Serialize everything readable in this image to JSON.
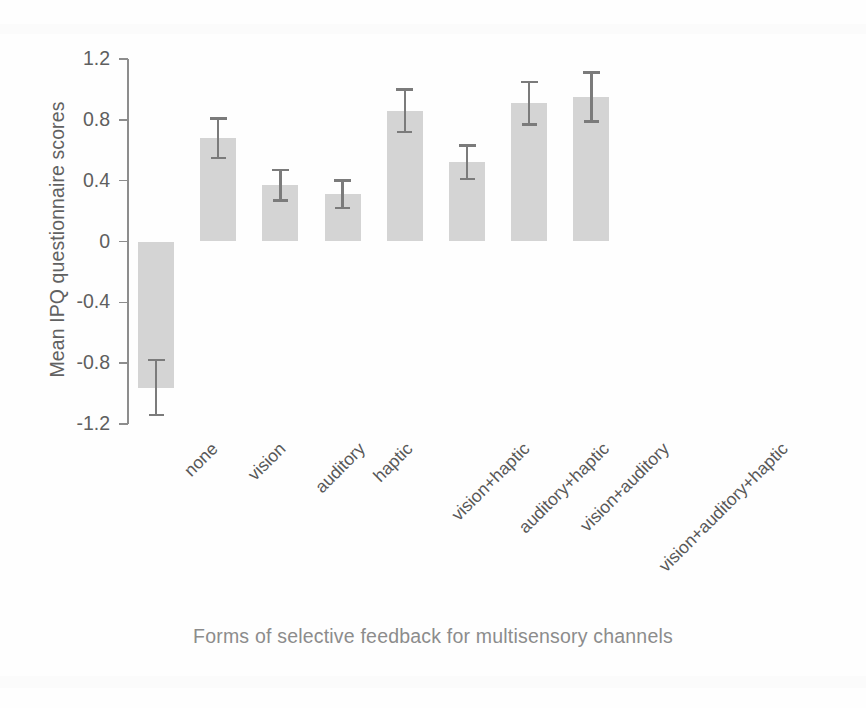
{
  "chart_data": {
    "type": "bar",
    "title": "",
    "subtitle": "",
    "xlabel": "Forms of selective feedback for multisensory channels",
    "ylabel": "Mean IPQ questionnaire scores",
    "categories": [
      "none",
      "vision",
      "auditory",
      "haptic",
      "vision+haptic",
      "auditory+haptic",
      "vision+auditory",
      "vision+auditory+haptic"
    ],
    "values": [
      -0.96,
      0.68,
      0.37,
      0.31,
      0.86,
      0.52,
      0.91,
      0.95
    ],
    "errors": [
      0.18,
      0.13,
      0.1,
      0.09,
      0.14,
      0.11,
      0.14,
      0.16
    ],
    "error_low": [
      -1.14,
      0.55,
      0.27,
      0.22,
      0.72,
      0.41,
      0.77,
      0.79
    ],
    "error_high": [
      -0.78,
      0.81,
      0.47,
      0.4,
      1.0,
      0.63,
      1.05,
      1.11
    ],
    "ylim": [
      -1.2,
      1.2
    ],
    "yticks": [
      1.2,
      0.8,
      0.4,
      0,
      -0.4,
      -0.8,
      -1.2
    ],
    "ytick_labels": [
      "1.2",
      "0.8",
      "0.4",
      "0",
      "-0.4",
      "-0.8",
      "-1.2"
    ],
    "grid": false,
    "legend": false,
    "legend_position": "none",
    "bar_color": "#d4d4d4",
    "error_color": "#7b7b7b",
    "axis_color": "#8d8d8d",
    "text_color": "#585858",
    "xtick_rotation": -45,
    "error_bar_note": "error bars shown as standard error whiskers"
  }
}
